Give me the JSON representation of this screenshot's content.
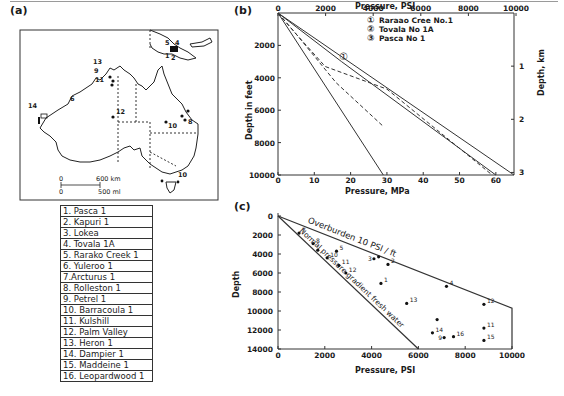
{
  "panels": {
    "a": {
      "label": "(a)"
    },
    "b": {
      "label": "(b)"
    },
    "c": {
      "label": "(c)"
    }
  },
  "map": {
    "scale_km": [
      "0",
      "600 km"
    ],
    "scale_mi": [
      "0",
      "500 ml"
    ],
    "wells": [
      {
        "id": "1",
        "label": "1"
      },
      {
        "id": "2",
        "label": "2"
      },
      {
        "id": "4",
        "label": "4"
      },
      {
        "id": "5",
        "label": "5"
      },
      {
        "id": "6",
        "label": "6"
      },
      {
        "id": "8",
        "label": "8"
      },
      {
        "id": "9",
        "label": "9"
      },
      {
        "id": "10a",
        "label": "10"
      },
      {
        "id": "10b",
        "label": "10"
      },
      {
        "id": "11",
        "label": "11"
      },
      {
        "id": "12",
        "label": "12"
      },
      {
        "id": "13",
        "label": "13"
      },
      {
        "id": "14",
        "label": "14"
      }
    ]
  },
  "well_list": [
    "1. Pasca 1",
    "2. Kapuri 1",
    "3. Lokea",
    "4. Tovala 1A",
    "5. Rarako Creek 1",
    "6. Yuleroo 1",
    "7.Arcturus 1",
    "8. Rolleston 1",
    "9. Petrel 1",
    "10. Barracoula 1",
    "11. Kulshill",
    "12. Palm Valley",
    "13. Heron 1",
    "14. Dampier 1",
    "15. Maddeine 1",
    "16. Leopardwood 1"
  ],
  "chart_data": [
    {
      "id": "b",
      "type": "line",
      "title": "",
      "xlabel_top": "Pressure, PSI",
      "xlabel_bottom": "Pressure, MPa",
      "ylabel_left": "Depth in feet",
      "ylabel_right": "Depth, km",
      "x_top_ticks": [
        "0",
        "2000",
        "4000",
        "6000",
        "8000",
        "10000"
      ],
      "x_top_range_psi": [
        0,
        9500
      ],
      "x_bottom_ticks": [
        "0",
        "10",
        "20",
        "30",
        "40",
        "50",
        "60"
      ],
      "x_bottom_range_mpa": [
        0,
        65
      ],
      "y_left_ticks": [
        "2000",
        "4000",
        "6000",
        "8000",
        "10000"
      ],
      "y_left_range_ft": [
        0,
        10000
      ],
      "y_right_ticks": [
        "1",
        "2",
        "3"
      ],
      "legend": [
        {
          "marker": "①",
          "name": "Raraao Cree No.1"
        },
        {
          "marker": "②",
          "name": "Tovala No 1A"
        },
        {
          "marker": "③",
          "name": "Pasca No 1"
        }
      ],
      "series": [
        {
          "name": "Overburden",
          "style": "solid",
          "points_mpa_ft": [
            [
              0,
              0
            ],
            [
              65,
              10000
            ]
          ]
        },
        {
          "name": "Hydrostatic",
          "style": "solid",
          "points_mpa_ft": [
            [
              0,
              0
            ],
            [
              29,
              10000
            ]
          ]
        },
        {
          "name": "Raraao Cree No.1",
          "style": "solid",
          "points_mpa_ft": [
            [
              0,
              0
            ],
            [
              17.5,
              3000
            ],
            [
              60,
              10000
            ]
          ]
        },
        {
          "name": "Tovala No 1A",
          "style": "dashed",
          "points_mpa_ft": [
            [
              0,
              0
            ],
            [
              5,
              1300
            ],
            [
              13,
              3300
            ],
            [
              30,
              4700
            ],
            [
              59,
              10000
            ]
          ]
        },
        {
          "name": "Pasca No 1",
          "style": "dashed",
          "points_mpa_ft": [
            [
              0,
              0
            ],
            [
              5,
              1300
            ],
            [
              16,
              4300
            ],
            [
              29,
              7000
            ]
          ]
        }
      ],
      "annotations": [
        {
          "text": "①",
          "at_mpa_ft": [
            18,
            2700
          ]
        }
      ]
    },
    {
      "id": "c",
      "type": "scatter",
      "title": "",
      "xlabel": "Pressure, PSI",
      "ylabel": "Depth",
      "x_ticks": [
        "0",
        "2000",
        "4000",
        "6000",
        "8000",
        "10000"
      ],
      "xlim": [
        0,
        10000
      ],
      "y_ticks": [
        "0",
        "2000",
        "4000",
        "6000",
        "8000",
        "10000",
        "12000",
        "14000"
      ],
      "ylim": [
        0,
        14000
      ],
      "lines": [
        {
          "name": "Overburden 10 PSI / ft",
          "points": [
            [
              0,
              0
            ],
            [
              10000,
              9700
            ],
            [
              10000,
              14000
            ]
          ]
        },
        {
          "name": "Normal pressure gradient fresh water",
          "points": [
            [
              0,
              0
            ],
            [
              6000,
              14000
            ]
          ]
        }
      ],
      "points": [
        {
          "label": "7",
          "x": 900,
          "y": 1800
        },
        {
          "label": "8",
          "x": 1500,
          "y": 2900
        },
        {
          "label": "",
          "x": 1700,
          "y": 3600
        },
        {
          "label": "5",
          "x": 2500,
          "y": 3700
        },
        {
          "label": "10",
          "x": 2100,
          "y": 4400
        },
        {
          "label": "11",
          "x": 2600,
          "y": 5200
        },
        {
          "label": "12",
          "x": 2900,
          "y": 6000
        },
        {
          "label": "3",
          "x": 4100,
          "y": 4500
        },
        {
          "label": "",
          "x": 4300,
          "y": 4300
        },
        {
          "label": "2",
          "x": 4700,
          "y": 5100
        },
        {
          "label": "1",
          "x": 4400,
          "y": 7100
        },
        {
          "label": "13",
          "x": 5500,
          "y": 9200
        },
        {
          "label": "4",
          "x": 7200,
          "y": 7400
        },
        {
          "label": "12",
          "x": 8800,
          "y": 9300
        },
        {
          "label": "",
          "x": 6800,
          "y": 10900
        },
        {
          "label": "14",
          "x": 6600,
          "y": 12300
        },
        {
          "label": "9",
          "x": 7100,
          "y": 12800
        },
        {
          "label": "16",
          "x": 7500,
          "y": 12700
        },
        {
          "label": "11",
          "x": 8800,
          "y": 11800
        },
        {
          "label": "15",
          "x": 8800,
          "y": 13100
        }
      ],
      "line_labels": [
        "Overburden 10 PSI / ft",
        "Normal pressure gradient fresh water"
      ]
    }
  ]
}
